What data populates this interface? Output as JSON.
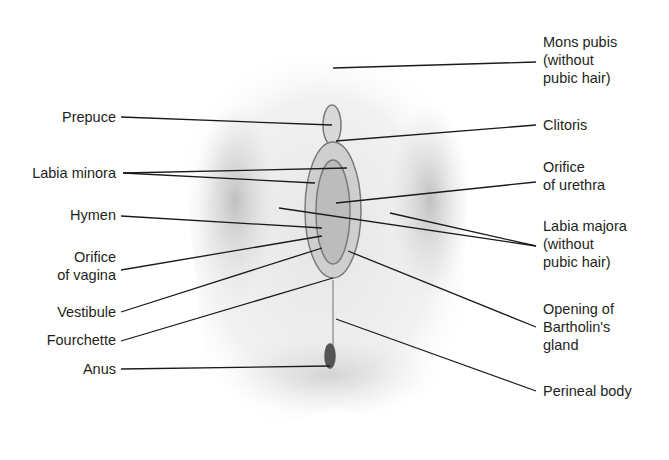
{
  "figure": {
    "type": "labeled anatomical diagram (schematic)",
    "colors": {
      "label_text": "#231f20",
      "leader_line": "#1a1a1a",
      "shading": "#9a9a9a"
    }
  },
  "labels_left": [
    {
      "id": "prepuce",
      "lines": [
        "Prepuce"
      ],
      "x": 116,
      "y": 108
    },
    {
      "id": "labia-minora",
      "lines": [
        "Labia minora"
      ],
      "x": 116,
      "y": 164
    },
    {
      "id": "hymen",
      "lines": [
        "Hymen"
      ],
      "x": 116,
      "y": 206
    },
    {
      "id": "orifice-vagina",
      "lines": [
        "Orifice",
        "of vagina"
      ],
      "x": 116,
      "y": 248
    },
    {
      "id": "vestibule",
      "lines": [
        "Vestibule"
      ],
      "x": 116,
      "y": 303
    },
    {
      "id": "fourchette",
      "lines": [
        "Fourchette"
      ],
      "x": 116,
      "y": 331
    },
    {
      "id": "anus",
      "lines": [
        "Anus"
      ],
      "x": 116,
      "y": 360
    }
  ],
  "labels_right": [
    {
      "id": "mons-pubis",
      "lines": [
        "Mons pubis",
        "(without",
        "pubic hair)"
      ],
      "x": 543,
      "y": 33
    },
    {
      "id": "clitoris",
      "lines": [
        "Clitoris"
      ],
      "x": 543,
      "y": 116
    },
    {
      "id": "orifice-urethra",
      "lines": [
        "Orifice",
        "of urethra"
      ],
      "x": 543,
      "y": 158
    },
    {
      "id": "labia-majora",
      "lines": [
        "Labia majora",
        "(without",
        "pubic hair)"
      ],
      "x": 543,
      "y": 217
    },
    {
      "id": "opening-bartholin",
      "lines": [
        "Opening of",
        "Bartholin's",
        "gland"
      ],
      "x": 543,
      "y": 300
    },
    {
      "id": "perineal-body",
      "lines": [
        "Perineal body"
      ],
      "x": 543,
      "y": 382
    }
  ],
  "leader_lines": [
    {
      "for": "prepuce",
      "x1": 121,
      "y1": 117,
      "x2": 332,
      "y2": 125
    },
    {
      "for": "labia-minora",
      "x1": 123,
      "y1": 173,
      "x2": 347,
      "y2": 168
    },
    {
      "for": "labia-minora",
      "x1": 123,
      "y1": 173,
      "x2": 315,
      "y2": 183
    },
    {
      "for": "hymen",
      "x1": 121,
      "y1": 216,
      "x2": 322,
      "y2": 228
    },
    {
      "for": "orifice-vagina",
      "x1": 121,
      "y1": 270,
      "x2": 322,
      "y2": 236
    },
    {
      "for": "vestibule",
      "x1": 121,
      "y1": 312,
      "x2": 322,
      "y2": 248
    },
    {
      "for": "fourchette",
      "x1": 121,
      "y1": 341,
      "x2": 333,
      "y2": 278
    },
    {
      "for": "anus",
      "x1": 121,
      "y1": 369,
      "x2": 330,
      "y2": 366
    },
    {
      "for": "mons-pubis",
      "x1": 333,
      "y1": 68,
      "x2": 536,
      "y2": 62
    },
    {
      "for": "clitoris",
      "x1": 336,
      "y1": 141,
      "x2": 536,
      "y2": 125
    },
    {
      "for": "orifice-urethra",
      "x1": 336,
      "y1": 203,
      "x2": 536,
      "y2": 182
    },
    {
      "for": "labia-majora",
      "x1": 279,
      "y1": 208,
      "x2": 536,
      "y2": 246
    },
    {
      "for": "labia-majora",
      "x1": 390,
      "y1": 213,
      "x2": 536,
      "y2": 246
    },
    {
      "for": "opening-bartholin",
      "x1": 348,
      "y1": 251,
      "x2": 536,
      "y2": 327
    },
    {
      "for": "perineal-body",
      "x1": 336,
      "y1": 319,
      "x2": 536,
      "y2": 391
    }
  ]
}
